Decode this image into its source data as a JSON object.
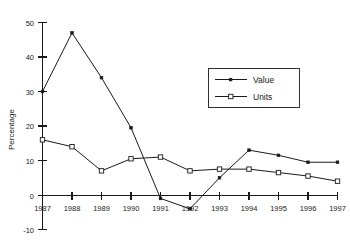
{
  "chart_data": {
    "type": "line",
    "title": "",
    "xlabel": "",
    "ylabel": "Percentage",
    "categories": [
      "1987",
      "1988",
      "1989",
      "1990",
      "1991",
      "1992",
      "1993",
      "1994",
      "1995",
      "1996",
      "1997"
    ],
    "x": [
      1987,
      1988,
      1989,
      1990,
      1991,
      1992,
      1993,
      1994,
      1995,
      1996,
      1997
    ],
    "series": [
      {
        "name": "Value",
        "marker": "filled-square",
        "values": [
          30,
          47,
          34,
          19.5,
          -1,
          -4,
          5,
          13,
          11.5,
          9.5,
          9.5
        ]
      },
      {
        "name": "Units",
        "marker": "open-square",
        "values": [
          16,
          14,
          7,
          10.5,
          11,
          7,
          7.5,
          7.5,
          6.5,
          5.5,
          4
        ]
      }
    ],
    "ylim": [
      -10,
      50
    ],
    "yticks": [
      -10,
      0,
      10,
      20,
      30,
      40,
      50
    ],
    "yticklabels": [
      "-10",
      "0",
      "10",
      "20",
      "30",
      "40",
      "50"
    ],
    "xticklabels": [
      "1987",
      "1988",
      "1989",
      "1990",
      "1991",
      "1992",
      "1993",
      "1994",
      "1995",
      "1996",
      "1997"
    ],
    "grid": false,
    "legend_position": "upper-center-right",
    "legend_entries": [
      "Value",
      "Units"
    ],
    "colors": {
      "line": "#1a1a1a",
      "axis": "#1a1a1a",
      "background": "#ffffff",
      "text": "#1a1a1a"
    }
  }
}
